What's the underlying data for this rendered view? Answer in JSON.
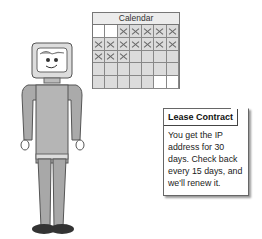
{
  "calendar": {
    "title": "Calendar",
    "rows": [
      [
        "blank",
        "blank",
        "x",
        "x",
        "x",
        "x",
        "x"
      ],
      [
        "x",
        "x",
        "x",
        "x",
        "x",
        "x",
        "x"
      ],
      [
        "x",
        "x",
        "x",
        "empty",
        "empty",
        "empty",
        "empty"
      ],
      [
        "empty",
        "empty",
        "empty",
        "empty",
        "empty",
        "empty",
        "empty"
      ],
      [
        "empty",
        "empty",
        "empty",
        "empty",
        "empty",
        "blank",
        "blank"
      ]
    ]
  },
  "card": {
    "title": "Lease Contract",
    "body": "You get the IP address for 30 days. Check back every 15 days, and we'll renew it."
  },
  "figure": {
    "name": "computer-head-character"
  }
}
